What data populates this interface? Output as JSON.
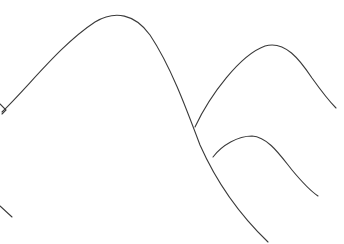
{
  "image": {
    "description": "Pencil line sketch of overlapping mountain silhouettes",
    "stroke_color": "#3a3a3a",
    "background": "#ffffff"
  }
}
